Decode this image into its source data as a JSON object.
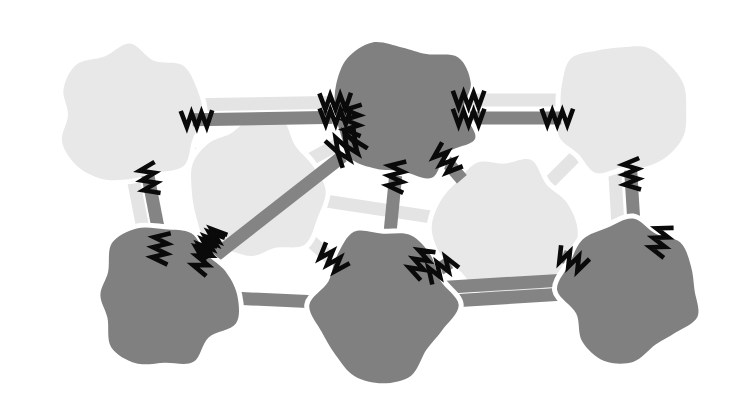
{
  "canvas": {
    "width": 734,
    "height": 394,
    "background": "#ffffff",
    "title": "Network graph of light and dark blob nodes joined by banded edges with zigzag endpoint marks"
  },
  "palette": {
    "light_node": "#e8e8e8",
    "dark_node": "#808080",
    "light_edge": "#e4e4e4",
    "dark_edge": "#848484",
    "zigzag": "#0a0a0a",
    "halo": "#ffffff",
    "background": "#ffffff"
  },
  "style": {
    "light_edge_width": 13,
    "dark_edge_width": 13,
    "halo_width": 22,
    "zigzag_stroke": 4.6,
    "zigzag_length": 30,
    "zigzag_amplitude": 7,
    "zigzag_cycles": 3
  },
  "legend": {
    "light_label": "light node",
    "dark_label": "dark node",
    "edge_label": "link",
    "mark_label": "spring mark"
  },
  "nodes": [
    {
      "id": "n-light-tl",
      "name": "light-node-top-left",
      "shade": "light",
      "cx": 130,
      "cy": 115,
      "rx": 72,
      "ry": 68,
      "seed": 11,
      "label": "L1"
    },
    {
      "id": "n-light-ml",
      "name": "light-node-mid-left",
      "shade": "light",
      "cx": 253,
      "cy": 190,
      "rx": 68,
      "ry": 72,
      "seed": 27,
      "label": "L2"
    },
    {
      "id": "n-dark-tc",
      "name": "dark-node-top-center",
      "shade": "dark",
      "cx": 402,
      "cy": 110,
      "rx": 72,
      "ry": 68,
      "seed": 41,
      "label": "D1"
    },
    {
      "id": "n-light-mr",
      "name": "light-node-mid-right",
      "shade": "light",
      "cx": 504,
      "cy": 228,
      "rx": 70,
      "ry": 72,
      "seed": 58,
      "label": "L3"
    },
    {
      "id": "n-light-tr",
      "name": "light-node-top-right",
      "shade": "light",
      "cx": 622,
      "cy": 110,
      "rx": 66,
      "ry": 66,
      "seed": 73,
      "label": "L4"
    },
    {
      "id": "n-dark-bl",
      "name": "dark-node-bottom-left",
      "shade": "dark",
      "cx": 165,
      "cy": 295,
      "rx": 70,
      "ry": 68,
      "seed": 89,
      "label": "D2"
    },
    {
      "id": "n-dark-bc",
      "name": "dark-node-bottom-center",
      "shade": "dark",
      "cx": 383,
      "cy": 305,
      "rx": 70,
      "ry": 73,
      "seed": 103,
      "label": "D3"
    },
    {
      "id": "n-dark-br",
      "name": "dark-node-bottom-right",
      "shade": "dark",
      "cx": 633,
      "cy": 290,
      "rx": 70,
      "ry": 70,
      "seed": 119,
      "label": "D4"
    }
  ],
  "edges": [
    {
      "id": "e1",
      "name": "edge-light-tl-to-dark-tc-upper",
      "from": "n-light-tl",
      "to": "n-dark-tc",
      "shade": "light",
      "offset": -9,
      "marks": [
        "to"
      ]
    },
    {
      "id": "e2",
      "name": "edge-light-tl-to-dark-tc-lower",
      "from": "n-light-tl",
      "to": "n-dark-tc",
      "shade": "dark",
      "offset": 6,
      "marks": [
        "from",
        "to"
      ]
    },
    {
      "id": "e3",
      "name": "edge-light-tl-to-light-ml",
      "from": "n-light-tl",
      "to": "n-light-ml",
      "shade": "light",
      "offset": 0,
      "marks": []
    },
    {
      "id": "e4",
      "name": "edge-light-tl-to-dark-bl",
      "from": "n-light-tl",
      "to": "n-dark-bl",
      "shade": "dark",
      "offset": -6,
      "marks": [
        "from"
      ]
    },
    {
      "id": "e5",
      "name": "edge-light-tl-to-dark-bl-halo",
      "from": "n-light-tl",
      "to": "n-dark-bl",
      "shade": "light",
      "offset": 9,
      "marks": []
    },
    {
      "id": "e6",
      "name": "edge-light-ml-to-dark-bl",
      "from": "n-light-ml",
      "to": "n-dark-bl",
      "shade": "dark",
      "offset": 0,
      "marks": [
        "from",
        "to"
      ]
    },
    {
      "id": "e7",
      "name": "edge-light-ml-to-dark-bc",
      "from": "n-light-ml",
      "to": "n-dark-bc",
      "shade": "light",
      "offset": 0,
      "marks": [
        "to"
      ]
    },
    {
      "id": "e8",
      "name": "edge-light-ml-to-dark-tc",
      "from": "n-light-ml",
      "to": "n-dark-tc",
      "shade": "light",
      "offset": 0,
      "marks": [
        "to"
      ]
    },
    {
      "id": "e9",
      "name": "edge-dark-tc-to-dark-bl",
      "from": "n-dark-tc",
      "to": "n-dark-bl",
      "shade": "dark",
      "offset": 0,
      "marks": [
        "from"
      ]
    },
    {
      "id": "e10",
      "name": "edge-dark-tc-to-dark-bc",
      "from": "n-dark-tc",
      "to": "n-dark-bc",
      "shade": "dark",
      "offset": 0,
      "marks": [
        "from"
      ]
    },
    {
      "id": "e11",
      "name": "edge-dark-tc-to-light-tr-upper",
      "from": "n-dark-tc",
      "to": "n-light-tr",
      "shade": "light",
      "offset": -10,
      "marks": [
        "from"
      ]
    },
    {
      "id": "e12",
      "name": "edge-dark-tc-to-light-tr-lower",
      "from": "n-dark-tc",
      "to": "n-light-tr",
      "shade": "dark",
      "offset": 8,
      "marks": [
        "from",
        "to"
      ]
    },
    {
      "id": "e13",
      "name": "edge-dark-tc-to-light-mr",
      "from": "n-dark-tc",
      "to": "n-light-mr",
      "shade": "dark",
      "offset": 0,
      "marks": [
        "from"
      ]
    },
    {
      "id": "e14",
      "name": "edge-light-mr-to-dark-bc",
      "from": "n-light-mr",
      "to": "n-dark-bc",
      "shade": "dark",
      "offset": 0,
      "marks": [
        "to"
      ]
    },
    {
      "id": "e15",
      "name": "edge-light-mr-to-dark-br",
      "from": "n-light-mr",
      "to": "n-dark-br",
      "shade": "dark",
      "offset": 0,
      "marks": [
        "to"
      ]
    },
    {
      "id": "e16",
      "name": "edge-light-tr-to-dark-br",
      "from": "n-light-tr",
      "to": "n-dark-br",
      "shade": "dark",
      "offset": -5,
      "marks": [
        "from"
      ]
    },
    {
      "id": "e17",
      "name": "edge-light-tr-to-dark-br-halo",
      "from": "n-light-tr",
      "to": "n-dark-br",
      "shade": "light",
      "offset": 11,
      "marks": []
    },
    {
      "id": "e18",
      "name": "edge-dark-bl-to-dark-bc",
      "from": "n-dark-bl",
      "to": "n-dark-bc",
      "shade": "dark",
      "offset": 0,
      "marks": []
    },
    {
      "id": "e19",
      "name": "edge-dark-bc-to-dark-br",
      "from": "n-dark-bc",
      "to": "n-dark-br",
      "shade": "dark",
      "offset": 0,
      "marks": []
    },
    {
      "id": "e20",
      "name": "edge-light-ml-to-light-mr",
      "from": "n-light-ml",
      "to": "n-light-mr",
      "shade": "light",
      "offset": 0,
      "marks": []
    },
    {
      "id": "e21",
      "name": "edge-light-tr-to-light-mr",
      "from": "n-light-tr",
      "to": "n-light-mr",
      "shade": "light",
      "offset": 0,
      "marks": []
    },
    {
      "id": "e22",
      "name": "edge-dark-br-to-dark-bc-low",
      "from": "n-dark-br",
      "to": "n-dark-bc",
      "shade": "dark",
      "offset": 14,
      "marks": []
    }
  ],
  "extra_marks": [
    {
      "id": "m1",
      "name": "spring-mark-dark-tc-left",
      "x": 352,
      "y": 120,
      "angle": 92,
      "label": "spring"
    },
    {
      "id": "m2",
      "name": "spring-mark-dark-bc-right",
      "x": 420,
      "y": 262,
      "angle": 118,
      "label": "spring"
    },
    {
      "id": "m3",
      "name": "spring-mark-dark-br-top",
      "x": 660,
      "y": 240,
      "angle": 108,
      "label": "spring"
    },
    {
      "id": "m4",
      "name": "spring-mark-dark-bl-mid",
      "x": 160,
      "y": 248,
      "angle": 96,
      "label": "spring"
    },
    {
      "id": "m5",
      "name": "spring-mark-dark-bl-right",
      "x": 203,
      "y": 258,
      "angle": 110,
      "label": "spring"
    }
  ]
}
